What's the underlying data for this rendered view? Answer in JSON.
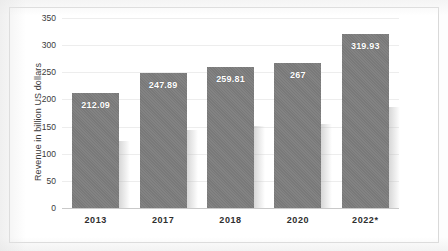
{
  "chart_data": {
    "type": "bar",
    "title": "",
    "subtitle": "",
    "xlabel": "",
    "ylabel": "Revenue in billion US dollars",
    "categories": [
      "2013",
      "2017",
      "2018",
      "2020",
      "2022*"
    ],
    "values": [
      212.09,
      247.89,
      259.81,
      267,
      319.93
    ],
    "data_labels": [
      "212.09",
      "247.89",
      "259.81",
      "267",
      "319.93"
    ],
    "ylim": [
      0,
      350
    ],
    "y_ticks": [
      0,
      50,
      100,
      150,
      200,
      250,
      300,
      350
    ],
    "y_tick_labels": [
      "0",
      "50",
      "100",
      "150",
      "200",
      "250",
      "300",
      "350"
    ],
    "grid": true,
    "legend": false,
    "legend_position": "none",
    "series": [
      {
        "name": "Revenue",
        "values": [
          212.09,
          247.89,
          259.81,
          267,
          319.93
        ]
      }
    ],
    "colors": {
      "bar": "#7d7d7d",
      "gridline": "#ededed",
      "axis": "#c9c9c9",
      "label_text": "#ffffff",
      "tick_text": "#3a3a3a",
      "frame": "#d9d9d9",
      "background": "#ffffff"
    }
  }
}
